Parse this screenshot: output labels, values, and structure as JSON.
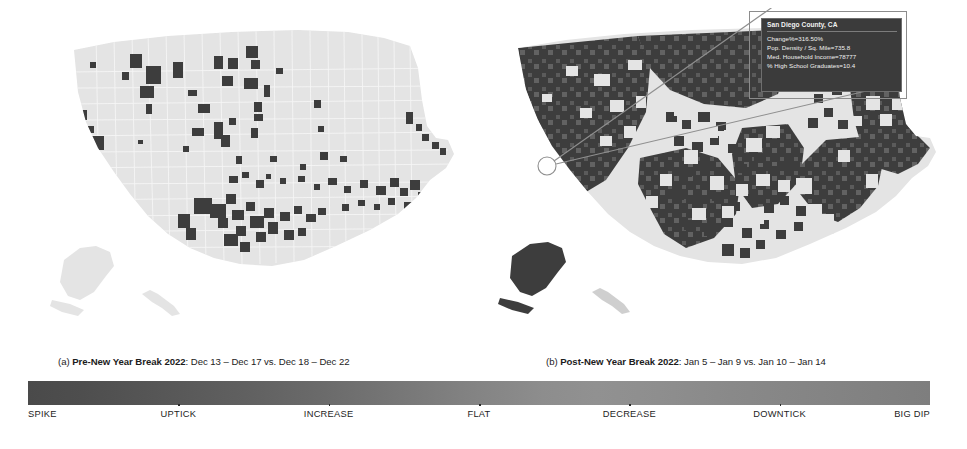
{
  "figure": {
    "panels": [
      {
        "id": "a",
        "tag": "(a)",
        "title": "Pre-New Year Break 2022",
        "detail": ": Dec 13 – Dec 17 vs. Dec 18 – Dec 22",
        "caption_full": "(a) Pre-New Year Break 2022: Dec 13 – Dec 17 vs. Dec 18 – Dec 22",
        "map_name": "us-county-choropleth-pre-new-year"
      },
      {
        "id": "b",
        "tag": "(b)",
        "title": "Post-New Year Break 2022",
        "detail": ": Jan 5 – Jan 9 vs. Jan 10 – Jan 14",
        "caption_full": "(b) Post-New Year Break 2022: Jan 5 – Jan 9 vs. Jan 10 – Jan 14",
        "map_name": "us-county-choropleth-post-new-year"
      }
    ]
  },
  "tooltip": {
    "title": "San Diego County, CA",
    "lines": [
      "Change%=316.50%",
      "Pop. Density / Sq. Mile=735.8",
      "Med. Household Income=78777",
      "% High School Graduates=10.4"
    ],
    "background": "#3b3b3b",
    "text_color": "#f2f2f2"
  },
  "chart_data": {
    "type": "heatmap",
    "title": "",
    "subtitle": "",
    "maps": [
      {
        "label": "(a) Pre-New Year Break 2022: Dec 13 – Dec 17 vs. Dec 18 – Dec 22",
        "geography": "United States counties",
        "fill_summary": "Majority of counties light gray (FLAT to DECREASE); a scattered minority of dark counties (SPIKE / UPTICK) concentrated in Texas, the Southeast, the Plains and Mountain West",
        "base_color": "#e2e2e2",
        "highlight_color": "#3d3d3d",
        "approx_dark_fraction": 0.06
      },
      {
        "label": "(b) Post-New Year Break 2022: Jan 5 – Jan 9 vs. Jan 10 – Jan 14",
        "geography": "United States counties",
        "fill_summary": "Majority of counties dark (SPIKE / UPTICK), with light patches across the central Plains, parts of the Midwest and the Northeast",
        "base_color": "#e2e2e2",
        "highlight_color": "#3d3d3d",
        "approx_dark_fraction": 0.62
      }
    ],
    "annotation": {
      "county": "San Diego County, CA",
      "on_map": "(b)",
      "marker": "circle-callout",
      "Change%": 316.5,
      "Pop. Density / Sq. Mile": 735.8,
      "Med. Household Income": 78777,
      "% High School Graduates": 10.4
    },
    "colorbar": {
      "orientation": "horizontal",
      "tick_labels": [
        "SPIKE",
        "UPTICK",
        "INCREASE",
        "FLAT",
        "DECREASE",
        "DOWNTICK",
        "BIG DIP"
      ],
      "tick_positions_pct": [
        0,
        16.67,
        33.33,
        50,
        66.67,
        83.33,
        100
      ],
      "gradient_from": "#4a4a4a",
      "gradient_mid": "#919191",
      "gradient_to": "#7e7e7e",
      "grid": false,
      "legend_position": "bottom"
    }
  },
  "colorbar_labels": [
    {
      "text": "SPIKE",
      "align": "start",
      "pos_pct": 0
    },
    {
      "text": "UPTICK",
      "align": "mid",
      "pos_pct": 16.67
    },
    {
      "text": "INCREASE",
      "align": "mid",
      "pos_pct": 33.33
    },
    {
      "text": "FLAT",
      "align": "mid",
      "pos_pct": 50
    },
    {
      "text": "DECREASE",
      "align": "mid",
      "pos_pct": 66.67
    },
    {
      "text": "DOWNTICK",
      "align": "mid",
      "pos_pct": 83.33
    },
    {
      "text": "BIG DIP",
      "align": "end",
      "pos_pct": 100
    }
  ]
}
